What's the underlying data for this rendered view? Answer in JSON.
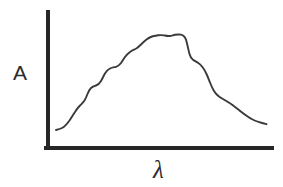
{
  "figure": {
    "kind": "hand-drawn-sketch",
    "background_color": "#ffffff",
    "axis_color": "#262626",
    "curve_color": "#3a3a3a",
    "y_axis_label": "A",
    "x_axis_label": "λ"
  },
  "chart_data": {
    "type": "line",
    "title": "",
    "subtitle": "",
    "xlabel": "λ",
    "ylabel": "A",
    "grid": false,
    "legend": null,
    "axis_style": "L-shaped spine, no tick marks, no tick labels",
    "xlim": [
      0,
      1
    ],
    "ylim": [
      0,
      1
    ],
    "x": [
      0.04,
      0.07,
      0.1,
      0.13,
      0.16,
      0.19,
      0.22,
      0.25,
      0.28,
      0.31,
      0.34,
      0.37,
      0.4,
      0.43,
      0.46,
      0.49,
      0.52,
      0.55,
      0.58,
      0.61,
      0.64,
      0.67,
      0.7,
      0.73,
      0.76,
      0.79,
      0.82,
      0.85,
      0.88,
      0.91,
      0.94,
      0.97,
      1.0
    ],
    "values": [
      0.13,
      0.13,
      0.15,
      0.19,
      0.25,
      0.32,
      0.39,
      0.43,
      0.44,
      0.49,
      0.55,
      0.6,
      0.63,
      0.64,
      0.68,
      0.74,
      0.79,
      0.84,
      0.88,
      0.91,
      0.92,
      0.92,
      0.93,
      0.93,
      0.91,
      0.78,
      0.74,
      0.71,
      0.6,
      0.46,
      0.36,
      0.28,
      0.23
    ],
    "annotations": []
  },
  "geometry": {
    "y_axis": {
      "x": 48,
      "y_top": 12,
      "y_bottom": 148
    },
    "x_axis": {
      "y": 148,
      "x_left": 48,
      "x_right": 272
    },
    "curve_path": "M 56 130 C 58 129.5 60 129 62 128 C 65 126.5 67 124 69.5 120.5 C 71.5 117.5 73 115 75 112 C 76.5 109.5 78 107.5 80 105.5 C 81.5 104 83 102.8 84.5 100.5 C 85.8 98.4 86.5 96.5 87.5 94 C 88.5 91.5 89.5 89.5 91 88 C 92.5 86.5 94 86 96 85.5 C 98 85 99.5 83.5 101 81 C 102.5 78.5 103.5 76 105 73.5 C 106.5 71 108 69.5 110 68.5 C 112 67.5 114 67.3 116 66.8 C 118 66.3 119.5 65 121 63 C 122.5 61 123.5 59 125 57 C 126.5 55 128 53.5 130 52 C 132 50.5 133.5 50 135.5 49 C 137.5 48 139 46.5 141 44.5 C 143 42.5 144.5 41 146.5 39.5 C 148.5 38 150 37.2 152 36.5 C 154 35.8 156 35.6 158 35.3 C 160 35 162 35 164 35.4 C 166 35.8 167.5 36.2 169.5 36 C 171.5 35.8 173 35.2 175 34.8 C 177 34.4 179 34.3 181 34.6 C 183 34.9 184.2 35.8 185.3 38 C 186.3 40 186.8 42.5 187.5 45.5 C 188.2 48.5 188.8 51.5 189.5 54 C 190.3 56.8 191.3 58.5 193 59.8 C 194.8 61.2 196.5 61.8 198.3 63 C 200 64.2 201.3 65.5 202.8 67.5 C 204.3 69.5 205.3 71.5 206.5 74 C 207.8 76.8 208.8 79.5 210 82.5 C 211.3 85.8 212.5 88.5 214 91 C 215.5 93.5 217 95 219 96.5 C 221 98 223 99 225.5 100.5 C 228 102 230 103.2 232.5 105 C 235 106.8 237 108.5 239.5 110.5 C 242 112.5 244 114 246.5 115.8 C 249 117.6 251 118.8 253.5 120 C 256 121.2 258 121.8 260.5 122.5 C 262.5 123 264.5 123.6 266.5 124.2"
  }
}
